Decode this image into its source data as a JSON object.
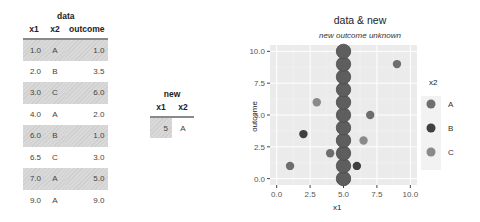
{
  "data_table": {
    "caption": "data",
    "headers": [
      "x1",
      "x2",
      "outcome"
    ],
    "rows": [
      {
        "x1": "1.0",
        "x2": "A",
        "outcome": "1.0",
        "shaded": true
      },
      {
        "x1": "2.0",
        "x2": "B",
        "outcome": "3.5",
        "shaded": false
      },
      {
        "x1": "3.0",
        "x2": "C",
        "outcome": "6.0",
        "shaded": true
      },
      {
        "x1": "4.0",
        "x2": "A",
        "outcome": "2.0",
        "shaded": false
      },
      {
        "x1": "6.0",
        "x2": "B",
        "outcome": "1.0",
        "shaded": true
      },
      {
        "x1": "6.5",
        "x2": "C",
        "outcome": "3.0",
        "shaded": false
      },
      {
        "x1": "7.0",
        "x2": "A",
        "outcome": "5.0",
        "shaded": true
      },
      {
        "x1": "9.0",
        "x2": "A",
        "outcome": "9.0",
        "shaded": false
      }
    ]
  },
  "new_table": {
    "caption": "new",
    "headers": [
      "x1",
      "x2"
    ],
    "rows": [
      {
        "x1": "5",
        "x2": "A"
      }
    ]
  },
  "chart_data": {
    "type": "scatter",
    "title": "data & new",
    "subtitle": "new outcome unknown",
    "xlabel": "x1",
    "ylabel": "outcome",
    "xlim": [
      -0.5,
      10.5
    ],
    "ylim": [
      -0.5,
      10.5
    ],
    "x_ticks": [
      "0.0",
      "2.5",
      "5.0",
      "7.5",
      "10.0"
    ],
    "y_ticks": [
      "0.0",
      "2.5",
      "5.0",
      "7.5",
      "10.0"
    ],
    "grid": true,
    "legend": {
      "title": "x2",
      "position": "right",
      "entries": [
        {
          "label": "A",
          "color": "#6e6e6e"
        },
        {
          "label": "B",
          "color": "#3f3f3f"
        },
        {
          "label": "C",
          "color": "#8a8a8a"
        }
      ]
    },
    "series": [
      {
        "name": "data",
        "points": [
          {
            "x": 1.0,
            "y": 1.0,
            "group": "A"
          },
          {
            "x": 2.0,
            "y": 3.5,
            "group": "B"
          },
          {
            "x": 3.0,
            "y": 6.0,
            "group": "C"
          },
          {
            "x": 4.0,
            "y": 2.0,
            "group": "A"
          },
          {
            "x": 6.0,
            "y": 1.0,
            "group": "B"
          },
          {
            "x": 6.5,
            "y": 3.0,
            "group": "C"
          },
          {
            "x": 7.0,
            "y": 5.0,
            "group": "A"
          },
          {
            "x": 9.0,
            "y": 9.0,
            "group": "A"
          }
        ]
      },
      {
        "name": "new",
        "note": "column of candidate outcomes at x1=5",
        "points": [
          {
            "x": 5,
            "y": 0
          },
          {
            "x": 5,
            "y": 1
          },
          {
            "x": 5,
            "y": 2
          },
          {
            "x": 5,
            "y": 3
          },
          {
            "x": 5,
            "y": 4
          },
          {
            "x": 5,
            "y": 5
          },
          {
            "x": 5,
            "y": 6
          },
          {
            "x": 5,
            "y": 7
          },
          {
            "x": 5,
            "y": 8
          },
          {
            "x": 5,
            "y": 9
          },
          {
            "x": 5,
            "y": 10
          }
        ],
        "color": "#5e5e5e"
      }
    ]
  }
}
